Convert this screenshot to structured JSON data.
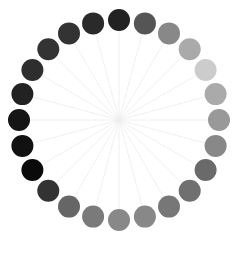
{
  "figure": {
    "type": "radial-dot-ring",
    "center": [
      119,
      120
    ],
    "ring_radius": 100,
    "dot_radius": 11,
    "spoke_color": "#ececec",
    "dots": [
      {
        "angle": -90,
        "color": "#222222"
      },
      {
        "angle": -75,
        "color": "#555555"
      },
      {
        "angle": -60,
        "color": "#888888"
      },
      {
        "angle": -45,
        "color": "#aaaaaa"
      },
      {
        "angle": -30,
        "color": "#cccccc"
      },
      {
        "angle": -15,
        "color": "#aaaaaa"
      },
      {
        "angle": 0,
        "color": "#999999"
      },
      {
        "angle": 15,
        "color": "#888888"
      },
      {
        "angle": 30,
        "color": "#6a6a6a"
      },
      {
        "angle": 45,
        "color": "#707070"
      },
      {
        "angle": 60,
        "color": "#777777"
      },
      {
        "angle": 75,
        "color": "#888888"
      },
      {
        "angle": 90,
        "color": "#888888"
      },
      {
        "angle": 105,
        "color": "#7a7a7a"
      },
      {
        "angle": 120,
        "color": "#666666"
      },
      {
        "angle": 135,
        "color": "#333333"
      },
      {
        "angle": 150,
        "color": "#0a0a0a"
      },
      {
        "angle": 165,
        "color": "#111111"
      },
      {
        "angle": 180,
        "color": "#151515"
      },
      {
        "angle": 195,
        "color": "#222222"
      },
      {
        "angle": 210,
        "color": "#2e2e2e"
      },
      {
        "angle": 225,
        "color": "#333333"
      },
      {
        "angle": 240,
        "color": "#333333"
      },
      {
        "angle": 255,
        "color": "#2a2a2a"
      }
    ]
  }
}
